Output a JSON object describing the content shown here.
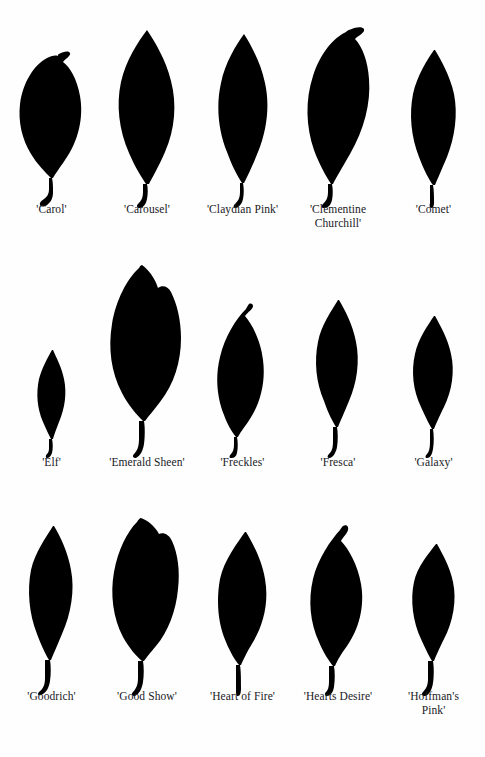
{
  "page": {
    "background_color": "#fefefe",
    "leaf_color": "#000000",
    "label_color": "#20201e",
    "columns": 5,
    "rows": 3,
    "total_specimens": 15
  },
  "rows": [
    {
      "row_index": 1,
      "specimens": [
        {
          "label": "'Carol'",
          "outline": "broad-ovate-hooked-tip"
        },
        {
          "label": "'Carousel'",
          "outline": "elongate-elliptic-acuminate"
        },
        {
          "label": "'Claydian Pink'",
          "outline": "narrow-elliptic-acuminate"
        },
        {
          "label": "'Clementine\nChurchill'",
          "outline": "large-ovate-hooked-tip"
        },
        {
          "label": "'Comet'",
          "outline": "narrow-elliptic-straight-petiole"
        }
      ]
    },
    {
      "row_index": 2,
      "specimens": [
        {
          "label": "'Elf'",
          "outline": "small-narrow-lanceolate"
        },
        {
          "label": "'Emerald Sheen'",
          "outline": "very-large-broad-obovate"
        },
        {
          "label": "'Freckles'",
          "outline": "asymmetric-ovate-curved-tip"
        },
        {
          "label": "'Fresca'",
          "outline": "narrow-elliptic-acuminate"
        },
        {
          "label": "'Galaxy'",
          "outline": "small-elliptic-acute"
        }
      ]
    },
    {
      "row_index": 3,
      "specimens": [
        {
          "label": "'Goodrich'",
          "outline": "narrow-elliptic-long-curved-petiole"
        },
        {
          "label": "'Good Show'",
          "outline": "very-broad-obovate-rounded"
        },
        {
          "label": "'Heart of Fire'",
          "outline": "ovate-acuminate"
        },
        {
          "label": "'Hearts Desire'",
          "outline": "broad-ovate-notched-tip"
        },
        {
          "label": "'Hoffman's\nPink'",
          "outline": "narrow-elliptic-acute"
        }
      ]
    }
  ]
}
